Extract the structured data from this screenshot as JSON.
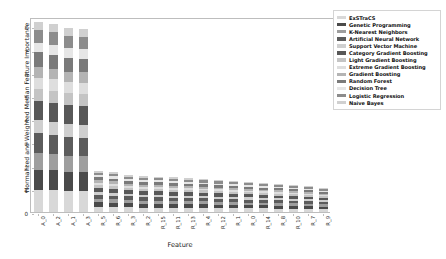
{
  "chart_data": {
    "type": "bar",
    "stacked": true,
    "title": "",
    "xlabel": "Feature",
    "ylabel": "Normalized and Weighted Median Feature Importance",
    "ylim": [
      0,
      8.4
    ],
    "yticks": [
      0,
      1,
      2,
      3,
      4,
      5,
      6,
      7,
      8
    ],
    "grid": false,
    "legend_position": "right",
    "categories": [
      "A_0",
      "A_2",
      "A_1",
      "A_3",
      "R_5",
      "R_6",
      "R_3",
      "R_2",
      "R_15",
      "R_11",
      "R_13",
      "R_4",
      "R_12",
      "R_1",
      "R_0",
      "R_14",
      "R_8",
      "R_10",
      "R_7",
      "R_9"
    ],
    "series": [
      {
        "name": "ExSTraCS",
        "color": "#d8d8d8",
        "values": [
          1.02,
          0.98,
          0.92,
          0.9,
          0.21,
          0.19,
          0.18,
          0.17,
          0.17,
          0.16,
          0.15,
          0.15,
          0.14,
          0.14,
          0.13,
          0.13,
          0.12,
          0.12,
          0.11,
          0.1
        ]
      },
      {
        "name": "Genetic Programming",
        "color": "#4a4a4a",
        "values": [
          0.94,
          0.9,
          0.86,
          0.84,
          0.17,
          0.16,
          0.16,
          0.15,
          0.15,
          0.14,
          0.14,
          0.13,
          0.13,
          0.12,
          0.12,
          0.11,
          0.11,
          0.1,
          0.1,
          0.09
        ]
      },
      {
        "name": "K-Nearest Neighbors",
        "color": "#9e9e9e",
        "values": [
          0.78,
          0.74,
          0.72,
          0.7,
          0.13,
          0.13,
          0.12,
          0.12,
          0.12,
          0.11,
          0.11,
          0.11,
          0.1,
          0.1,
          0.1,
          0.09,
          0.09,
          0.09,
          0.08,
          0.08
        ]
      },
      {
        "name": "Artificial Neural Network",
        "color": "#5c5c5c",
        "values": [
          0.9,
          0.86,
          0.83,
          0.8,
          0.16,
          0.15,
          0.15,
          0.14,
          0.14,
          0.13,
          0.13,
          0.12,
          0.12,
          0.12,
          0.11,
          0.11,
          0.1,
          0.1,
          0.09,
          0.09
        ]
      },
      {
        "name": "Support Vector Machine",
        "color": "#cfcfcf",
        "values": [
          0.62,
          0.6,
          0.58,
          0.57,
          0.11,
          0.11,
          0.1,
          0.1,
          0.1,
          0.09,
          0.09,
          0.09,
          0.09,
          0.08,
          0.08,
          0.08,
          0.07,
          0.07,
          0.07,
          0.06
        ]
      },
      {
        "name": "Category Gradient Boosting",
        "color": "#585858",
        "values": [
          0.88,
          0.86,
          0.83,
          0.82,
          0.15,
          0.15,
          0.14,
          0.14,
          0.13,
          0.13,
          0.12,
          0.12,
          0.12,
          0.11,
          0.11,
          0.1,
          0.1,
          0.09,
          0.09,
          0.08
        ]
      },
      {
        "name": "Light Gradient Boosting",
        "color": "#c4c4c4",
        "values": [
          0.56,
          0.55,
          0.53,
          0.52,
          0.1,
          0.1,
          0.09,
          0.09,
          0.09,
          0.09,
          0.08,
          0.08,
          0.08,
          0.07,
          0.07,
          0.07,
          0.07,
          0.06,
          0.06,
          0.06
        ]
      },
      {
        "name": "Extreme Gradient Boosting",
        "color": "#dedede",
        "values": [
          0.52,
          0.51,
          0.5,
          0.48,
          0.09,
          0.09,
          0.09,
          0.08,
          0.08,
          0.08,
          0.08,
          0.07,
          0.07,
          0.07,
          0.07,
          0.06,
          0.06,
          0.06,
          0.05,
          0.05
        ]
      },
      {
        "name": "Gradient Boosting",
        "color": "#b4b4b4",
        "values": [
          0.5,
          0.49,
          0.47,
          0.46,
          0.09,
          0.09,
          0.08,
          0.08,
          0.08,
          0.08,
          0.07,
          0.07,
          0.07,
          0.07,
          0.06,
          0.06,
          0.06,
          0.05,
          0.05,
          0.05
        ]
      },
      {
        "name": "Random Forest",
        "color": "#7a7a7a",
        "values": [
          0.66,
          0.64,
          0.62,
          0.6,
          0.12,
          0.11,
          0.11,
          0.11,
          0.1,
          0.1,
          0.1,
          0.09,
          0.09,
          0.09,
          0.08,
          0.08,
          0.08,
          0.07,
          0.07,
          0.07
        ]
      },
      {
        "name": "Decision Tree",
        "color": "#e6e6e6",
        "values": [
          0.44,
          0.43,
          0.42,
          0.41,
          0.08,
          0.08,
          0.07,
          0.07,
          0.07,
          0.07,
          0.06,
          0.06,
          0.06,
          0.06,
          0.06,
          0.05,
          0.05,
          0.05,
          0.05,
          0.04
        ]
      },
      {
        "name": "Logistic Regression",
        "color": "#8c8c8c",
        "values": [
          0.6,
          0.58,
          0.56,
          0.55,
          0.1,
          0.1,
          0.1,
          0.09,
          0.09,
          0.09,
          0.08,
          0.08,
          0.08,
          0.08,
          0.07,
          0.07,
          0.07,
          0.06,
          0.06,
          0.06
        ]
      },
      {
        "name": "Naive Bayes",
        "color": "#d0d0d0",
        "values": [
          0.38,
          0.37,
          0.36,
          0.35,
          0.07,
          0.07,
          0.06,
          0.06,
          0.06,
          0.06,
          0.06,
          0.05,
          0.05,
          0.05,
          0.05,
          0.05,
          0.04,
          0.04,
          0.04,
          0.04
        ]
      }
    ],
    "bar_totals": [
      8.2,
      8.1,
      7.95,
      7.9,
      1.78,
      1.73,
      1.6,
      1.55,
      1.53,
      1.5,
      1.45,
      1.42,
      1.38,
      1.35,
      1.3,
      1.26,
      1.22,
      1.16,
      1.12,
      1.05
    ]
  }
}
